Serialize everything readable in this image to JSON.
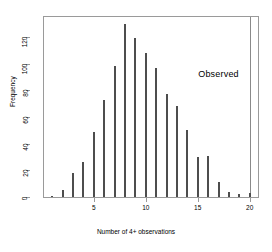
{
  "chart_data": {
    "type": "bar",
    "title": "",
    "subtitle": "",
    "xlabel": "Number of 4+ observations",
    "ylabel": "Frequency",
    "x": [
      1,
      2,
      3,
      4,
      5,
      6,
      7,
      8,
      9,
      10,
      11,
      12,
      13,
      14,
      15,
      16,
      17,
      18,
      19,
      20
    ],
    "values": [
      1,
      5,
      18,
      26,
      49,
      73,
      98,
      130,
      119,
      108,
      97,
      77,
      68,
      50,
      30,
      31,
      11,
      4,
      2,
      3
    ],
    "categories": [
      "1",
      "2",
      "3",
      "4",
      "5",
      "6",
      "7",
      "8",
      "9",
      "10",
      "11",
      "12",
      "13",
      "14",
      "15",
      "16",
      "17",
      "18",
      "19",
      "20"
    ],
    "xlim": [
      0.2,
      20.8
    ],
    "ylim": [
      0,
      135
    ],
    "xticks": [
      5,
      10,
      15,
      20
    ],
    "xticklabels": [
      "5",
      "10",
      "15",
      "20"
    ],
    "yticks": [
      0,
      20,
      40,
      60,
      80,
      100,
      120
    ],
    "yticklabels": [
      "0",
      "20",
      "40",
      "60",
      "80",
      "100",
      "120"
    ],
    "grid": false,
    "legend": null,
    "bar_color": "#4d4d4d",
    "frame_color": "#9a9a9a",
    "annotations": [
      {
        "name": "observed-label",
        "text": "Observed",
        "x": 17.0,
        "y": 92
      }
    ],
    "reference_lines": [
      {
        "name": "observed-line",
        "orientation": "vertical",
        "x": 20.0,
        "color": "#8a8a8a"
      }
    ]
  }
}
